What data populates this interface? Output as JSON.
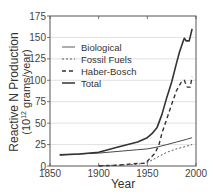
{
  "chart_data": {
    "type": "line",
    "title": "",
    "xlabel": "Year",
    "ylabel": "Reactive N Production",
    "ylabel_units": "(10^12 grams/year)",
    "xlim": [
      1850,
      2000
    ],
    "ylim": [
      0,
      175
    ],
    "x_ticks": [
      1850,
      1900,
      1950,
      2000
    ],
    "y_ticks": [
      0,
      25,
      50,
      75,
      100,
      125,
      150,
      175
    ],
    "grid": "horizontal",
    "legend_position": "upper-left",
    "series": [
      {
        "name": "Biological",
        "style": "solid-thin",
        "x": [
          1860,
          1880,
          1900,
          1920,
          1940,
          1950,
          1960,
          1970,
          1980,
          1990,
          1996
        ],
        "y": [
          13,
          14,
          15,
          17,
          19,
          20,
          22,
          25,
          28,
          31,
          33
        ]
      },
      {
        "name": "Fossil Fuels",
        "style": "dotted",
        "x": [
          1900,
          1920,
          1940,
          1950,
          1960,
          1970,
          1980,
          1990,
          1996
        ],
        "y": [
          0.5,
          1,
          2,
          4,
          10,
          16,
          20,
          23,
          25
        ]
      },
      {
        "name": "Haber-Bosch",
        "style": "dashed",
        "x": [
          1900,
          1920,
          1940,
          1948,
          1952,
          1958,
          1962,
          1965,
          1970,
          1975,
          1980,
          1985,
          1988,
          1991,
          1994,
          1996
        ],
        "y": [
          0,
          1,
          3,
          3,
          8,
          15,
          25,
          38,
          55,
          72,
          88,
          98,
          100,
          92,
          92,
          104
        ]
      },
      {
        "name": "Total",
        "style": "solid-thick",
        "x": [
          1860,
          1880,
          1900,
          1920,
          1940,
          1950,
          1955,
          1960,
          1965,
          1970,
          1975,
          1980,
          1983,
          1986,
          1988,
          1990,
          1993,
          1995,
          1996
        ],
        "y": [
          13,
          14,
          16,
          22,
          28,
          33,
          38,
          45,
          60,
          80,
          98,
          120,
          133,
          143,
          149,
          146,
          146,
          155,
          160
        ]
      }
    ]
  },
  "legend": {
    "items": [
      {
        "label": "Biological"
      },
      {
        "label": "Fossil Fuels"
      },
      {
        "label": "Haber-Bosch"
      },
      {
        "label": "Total"
      }
    ]
  },
  "axes": {
    "x_title": "Year",
    "y_title_line1": "Reactive N Production",
    "y_title_line2_prefix": "(10",
    "y_title_line2_sup": "12",
    "y_title_line2_suffix": " grams/year)",
    "x_tick_labels": [
      "1850",
      "1900",
      "1950",
      "2000"
    ],
    "y_tick_labels": [
      "0",
      "25",
      "50",
      "75",
      "100",
      "125",
      "150",
      "175"
    ]
  },
  "colors": {
    "line": "#333333",
    "grid": "#d9d9d9",
    "frame": "#555555"
  }
}
